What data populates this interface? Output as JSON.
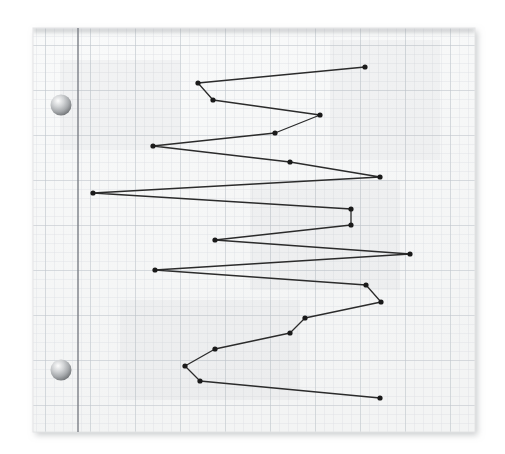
{
  "document": {
    "title": "Graph paper sketch",
    "background_color": "#ffffff",
    "paper": {
      "name": "graph-paper-sheet",
      "x": 33,
      "y": 28,
      "width": 442,
      "height": 404,
      "fill_color": "#f7f8f8",
      "edge_color": "#e2e3e3",
      "shadow_color": "#b9bbbc"
    },
    "grid": {
      "minor_spacing": 9,
      "minor_color": "#dfe3e8",
      "major_spacing": 45,
      "major_color": "#c3c9d0",
      "show_minor": true,
      "show_major": true
    },
    "margin_rule": {
      "name": "margin-line",
      "x": 78,
      "color": "#7b7f86",
      "width": 1.4
    },
    "hole_punches": [
      {
        "name": "hole-punch-top",
        "cx": 61,
        "cy": 105,
        "r": 10.5
      },
      {
        "name": "hole-punch-bottom",
        "cx": 61,
        "cy": 370,
        "r": 10.5
      }
    ],
    "hole_color_light": "#ffffff",
    "hole_color_mid": "#b9bbbd",
    "hole_color_dark": "#7e8083"
  },
  "chart_data": {
    "type": "line",
    "title": "",
    "subtitle": "",
    "xlabel": "",
    "ylabel": "",
    "orientation": "vertical-zigzag",
    "grid": true,
    "legend": null,
    "axis_ticks_visible": false,
    "xlim": [
      33,
      475
    ],
    "ylim": [
      28,
      432
    ],
    "line_color": "#2b2b2b",
    "line_width": 1.3,
    "marker": "circle",
    "marker_size": 2.6,
    "marker_color": "#1a1a1a",
    "point_count": 25,
    "comment_units": "pixel coordinates on the sheet; series walks top-to-bottom",
    "x": [
      365,
      198,
      213,
      320,
      153,
      275,
      290,
      380,
      93,
      351,
      351,
      215,
      410,
      155,
      366,
      381,
      305,
      290,
      215,
      185,
      200,
      380
    ],
    "y": [
      67,
      83,
      100,
      115,
      146,
      133,
      162,
      177,
      193,
      209,
      225,
      240,
      254,
      270,
      285,
      302,
      318,
      333,
      349,
      366,
      381,
      398
    ],
    "points": [
      {
        "x": 365,
        "y": 67
      },
      {
        "x": 198,
        "y": 83
      },
      {
        "x": 213,
        "y": 100
      },
      {
        "x": 320,
        "y": 115
      },
      {
        "x": 153,
        "y": 146
      },
      {
        "x": 275,
        "y": 133
      },
      {
        "x": 290,
        "y": 162
      },
      {
        "x": 380,
        "y": 177
      },
      {
        "x": 93,
        "y": 193
      },
      {
        "x": 351,
        "y": 209
      },
      {
        "x": 351,
        "y": 225
      },
      {
        "x": 215,
        "y": 240
      },
      {
        "x": 410,
        "y": 254
      },
      {
        "x": 155,
        "y": 270
      },
      {
        "x": 366,
        "y": 285
      },
      {
        "x": 381,
        "y": 302
      },
      {
        "x": 305,
        "y": 318
      },
      {
        "x": 290,
        "y": 333
      },
      {
        "x": 215,
        "y": 349
      },
      {
        "x": 185,
        "y": 366
      },
      {
        "x": 200,
        "y": 381
      },
      {
        "x": 380,
        "y": 398
      }
    ],
    "path_order": [
      0,
      1,
      2,
      3,
      5,
      4,
      6,
      7,
      8,
      9,
      10,
      11,
      12,
      13,
      14,
      15,
      16,
      17,
      18,
      19,
      20,
      21
    ]
  }
}
